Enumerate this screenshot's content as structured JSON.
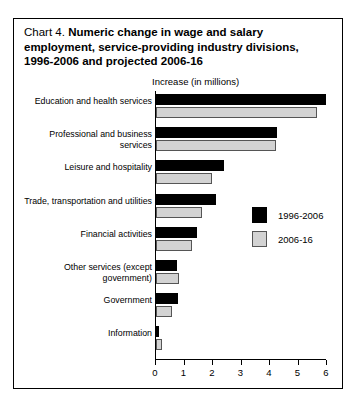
{
  "title": {
    "lead": "Chart 4.",
    "bold_line1": "Numeric change in wage and salary",
    "bold_line2": "employment, service-providing industry divisions,",
    "bold_line3": "1996-2006 and projected 2006-16"
  },
  "legend": {
    "items": [
      {
        "label": "1996-2006",
        "color": "#000000",
        "swatch": "black-square-swatch"
      },
      {
        "label": "2006-16",
        "color": "#d3d3d3",
        "swatch": "grey-square-swatch"
      }
    ]
  },
  "chart_data": {
    "type": "bar",
    "orientation": "horizontal",
    "title": "Chart 4. Numeric change in wage and salary employment, service-providing industry divisions, 1996-2006 and projected 2006-16",
    "xlabel": "Increase (in millions)",
    "ylabel": "",
    "xlim": [
      0,
      6
    ],
    "xticks": [
      "0",
      "1",
      "2",
      "3",
      "4",
      "5",
      "6"
    ],
    "grid": false,
    "legend_position": "middle-right",
    "categories": [
      "Education and health services",
      "Professional and business services",
      "Leisure and hospitality",
      "Trade, transportation and utilities",
      "Financial activities",
      "Other services (except government)",
      "Government",
      "Information"
    ],
    "series": [
      {
        "name": "1996-2006",
        "color": "#000000",
        "values": [
          5.95,
          4.25,
          2.4,
          2.1,
          1.45,
          0.75,
          0.78,
          0.12
        ]
      },
      {
        "name": "2006-16",
        "color": "#d3d3d3",
        "values": [
          5.65,
          4.2,
          1.95,
          1.6,
          1.25,
          0.8,
          0.55,
          0.2
        ]
      }
    ]
  }
}
